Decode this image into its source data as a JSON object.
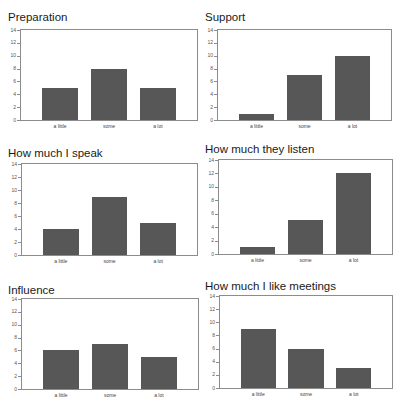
{
  "colors": {
    "bar": "#575757",
    "frame": "#8c8c8c",
    "text": "#1a1a1a"
  },
  "chart_data": [
    {
      "type": "bar",
      "title": "Preparation",
      "categories": [
        "a little",
        "some",
        "a lot"
      ],
      "values": [
        5,
        8,
        5
      ],
      "xlabel": "",
      "ylabel": "",
      "ylim": [
        0,
        14
      ],
      "yticks": [
        0,
        2,
        4,
        6,
        8,
        10,
        12,
        14
      ],
      "grid": false,
      "legend": null
    },
    {
      "type": "bar",
      "title": "Support",
      "categories": [
        "a little",
        "some",
        "a lot"
      ],
      "values": [
        1,
        7,
        10
      ],
      "xlabel": "",
      "ylabel": "",
      "ylim": [
        0,
        14
      ],
      "yticks": [
        0,
        2,
        4,
        6,
        8,
        10,
        12,
        14
      ],
      "grid": false,
      "legend": null
    },
    {
      "type": "bar",
      "title": "How much I speak",
      "categories": [
        "a little",
        "some",
        "a lot"
      ],
      "values": [
        4,
        9,
        5
      ],
      "xlabel": "",
      "ylabel": "",
      "ylim": [
        0,
        14
      ],
      "yticks": [
        0,
        2,
        4,
        6,
        8,
        10,
        12,
        14
      ],
      "grid": false,
      "legend": null
    },
    {
      "type": "bar",
      "title": "How much they listen",
      "categories": [
        "a little",
        "some",
        "a lot"
      ],
      "values": [
        1,
        5,
        12
      ],
      "xlabel": "",
      "ylabel": "",
      "ylim": [
        0,
        14
      ],
      "yticks": [
        0,
        2,
        4,
        6,
        8,
        10,
        12,
        14
      ],
      "grid": false,
      "legend": null
    },
    {
      "type": "bar",
      "title": "Influence",
      "categories": [
        "a little",
        "some",
        "a lot"
      ],
      "values": [
        6,
        7,
        5
      ],
      "xlabel": "",
      "ylabel": "",
      "ylim": [
        0,
        14
      ],
      "yticks": [
        0,
        2,
        4,
        6,
        8,
        10,
        12,
        14
      ],
      "grid": false,
      "legend": null
    },
    {
      "type": "bar",
      "title": "How much I like meetings",
      "categories": [
        "a little",
        "some",
        "a lot"
      ],
      "values": [
        9,
        6,
        3
      ],
      "xlabel": "",
      "ylabel": "",
      "ylim": [
        0,
        14
      ],
      "yticks": [
        0,
        2,
        4,
        6,
        8,
        10,
        12,
        14
      ],
      "grid": false,
      "legend": null
    }
  ]
}
